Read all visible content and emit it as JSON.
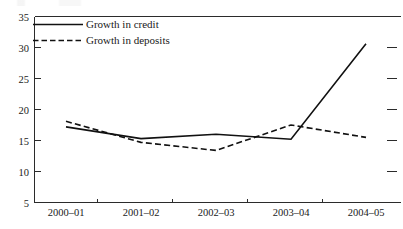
{
  "chart_data": {
    "type": "line",
    "title": "",
    "subtitle": "",
    "xlabel": "",
    "ylabel": "",
    "categories": [
      "2000–01",
      "2001–02",
      "2002–03",
      "2003–04",
      "2004–05"
    ],
    "ylim": [
      5,
      35
    ],
    "yticks": [
      5,
      10,
      15,
      20,
      25,
      30,
      35
    ],
    "ytick_labels": [
      "5",
      "10",
      "15",
      "20",
      "25",
      "30",
      "35"
    ],
    "grid": false,
    "legend_position": "top-left inside plot",
    "series": [
      {
        "name": "Growth in credit",
        "style": "solid",
        "color": "#111111",
        "values": [
          17.2,
          15.3,
          16.0,
          15.2,
          30.6
        ]
      },
      {
        "name": "Growth in deposits",
        "style": "dashed",
        "color": "#111111",
        "values": [
          18.1,
          14.7,
          13.4,
          17.5,
          15.5
        ]
      }
    ]
  },
  "legend": {
    "entries": [
      {
        "label": "Growth in credit",
        "style": "solid"
      },
      {
        "label": "Growth in deposits",
        "style": "dashed"
      }
    ]
  },
  "axes": {
    "y_tick_labels": [
      "35",
      "30",
      "25",
      "20",
      "15",
      "10",
      "5"
    ],
    "x_tick_labels": [
      "2000–01",
      "2001–02",
      "2002–03",
      "2003–04",
      "2004–05"
    ]
  },
  "colors": {
    "line": "#111111",
    "axis": "#2b2b2b",
    "background": "#ffffff",
    "text": "#1a1a1a"
  }
}
